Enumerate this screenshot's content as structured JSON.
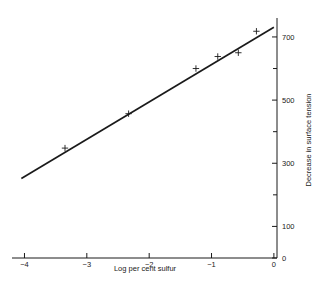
{
  "chart_data": {
    "type": "scatter",
    "title": "",
    "xlabel": "Log per cent sulfur",
    "ylabel": "Decrease in surface tension",
    "xlim": [
      -4.2,
      0.05
    ],
    "ylim": [
      0,
      760
    ],
    "grid": false,
    "legend": null,
    "x_ticks": [
      {
        "value": -4,
        "label": "−4",
        "major": true
      },
      {
        "value": -3,
        "label": "−3",
        "major": true
      },
      {
        "value": -2,
        "label": "−2",
        "major": true
      },
      {
        "value": -1,
        "label": "−1",
        "major": true
      },
      {
        "value": 0,
        "label": "0",
        "major": true
      }
    ],
    "y_ticks": [
      {
        "value": 0,
        "label": "0",
        "major": true
      },
      {
        "value": 100,
        "label": "100",
        "major": true
      },
      {
        "value": 200,
        "label": "",
        "major": false
      },
      {
        "value": 300,
        "label": "300",
        "major": true
      },
      {
        "value": 400,
        "label": "",
        "major": false
      },
      {
        "value": 500,
        "label": "500",
        "major": true
      },
      {
        "value": 600,
        "label": "",
        "major": false
      },
      {
        "value": 700,
        "label": "700",
        "major": true
      }
    ],
    "y_axis_side": "right",
    "x_axis_side": "bottom",
    "marker": "plus",
    "points": [
      {
        "x": -3.35,
        "y": 348
      },
      {
        "x": -2.33,
        "y": 457
      },
      {
        "x": -1.25,
        "y": 600
      },
      {
        "x": -0.9,
        "y": 638
      },
      {
        "x": -0.57,
        "y": 650
      },
      {
        "x": -0.28,
        "y": 718
      }
    ],
    "fit_line": {
      "type": "linear",
      "x_start": -4.05,
      "y_start": 252,
      "x_end": 0.0,
      "y_end": 731,
      "slope": 118.3,
      "intercept": 731
    }
  },
  "figure": {
    "caption": ""
  }
}
